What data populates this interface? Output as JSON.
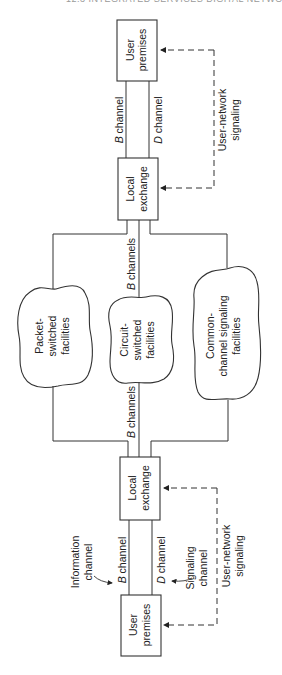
{
  "page": {
    "header": "12.3 INTEGRATED SERVICES DIGITAL NETWORK"
  },
  "diagram": {
    "orientation": "rotated-90-ccw",
    "nodes": {
      "user_premises_top": {
        "line1": "User",
        "line2": "premises"
      },
      "local_exchange_top": {
        "line1": "Local",
        "line2": "exchange"
      },
      "local_exchange_bottom": {
        "line1": "Local",
        "line2": "exchange"
      },
      "user_premises_bottom": {
        "line1": "User",
        "line2": "premises"
      },
      "packet_switched": {
        "line1": "Packet-",
        "line2": "switched",
        "line3": "facilities"
      },
      "circuit_switched": {
        "line1": "Circuit-",
        "line2": "switched",
        "line3": "facilities"
      },
      "common_channel": {
        "line1": "Common-",
        "line2": "channel signaling",
        "line3": "facilities"
      }
    },
    "labels": {
      "b_channel_top": {
        "letter": "B",
        "word": " channel"
      },
      "d_channel_top": {
        "letter": "D",
        "word": " channel"
      },
      "user_network_signaling_top": {
        "line1": "User-network",
        "line2": "signaling"
      },
      "b_channels_upper": {
        "letter": "B",
        "word": " channels"
      },
      "b_channels_lower": {
        "letter": "B",
        "word": " channels"
      },
      "b_channel_bottom": {
        "letter": "B",
        "word": " channel"
      },
      "d_channel_bottom": {
        "letter": "D",
        "word": " channel"
      },
      "information_channel": {
        "line1": "Information",
        "line2": "channel"
      },
      "signaling_channel": {
        "line1": "Signaling",
        "line2": "channel"
      },
      "user_network_signaling_bottom": {
        "line1": "User-network",
        "line2": "signaling"
      }
    },
    "colors": {
      "stroke": "#333333",
      "text": "#222222",
      "background": "#ffffff"
    }
  }
}
